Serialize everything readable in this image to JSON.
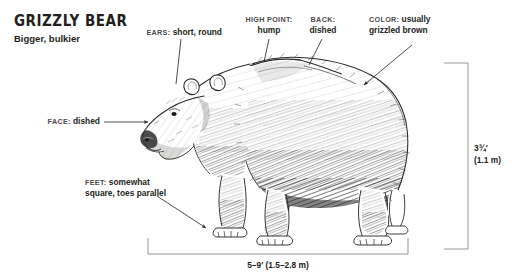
{
  "header": {
    "title": "GRIZZLY BEAR",
    "subtitle": "Bigger, bulkier"
  },
  "illustration": {
    "subject": "grizzly-bear",
    "style": "pen-and-ink hatched line drawing",
    "facing": "left",
    "ink_color": "#2b2a29",
    "background": "#ffffff"
  },
  "callouts": [
    {
      "id": "ears",
      "key": "EARS:",
      "value": "short, round",
      "leader": "line"
    },
    {
      "id": "high-point",
      "key": "HIGH POINT:",
      "value": "hump",
      "leader": "line"
    },
    {
      "id": "back",
      "key": "BACK:",
      "value": "dished",
      "leader": "line"
    },
    {
      "id": "color",
      "key": "COLOR:",
      "value": "usually grizzled brown",
      "leader": "arrow"
    },
    {
      "id": "face",
      "key": "FACE:",
      "value": "dished",
      "leader": "arrow"
    },
    {
      "id": "feet",
      "key": "FEET:",
      "value": "somewhat square, toes parallel",
      "leader": "arrow"
    }
  ],
  "callout_text": {
    "ears_key": "EARS:",
    "ears_value": "short, round",
    "high_point_key": "HIGH POINT:",
    "high_point_value": "hump",
    "back_key": "BACK:",
    "back_value": "dished",
    "color_key": "COLOR:",
    "color_value_line1": "usually",
    "color_value_line2": "grizzled brown",
    "face_key": "FACE:",
    "face_value": "dished",
    "feet_key": "FEET:",
    "feet_value_line1": "somewhat",
    "feet_value_line2": "square, toes parallel"
  },
  "dimensions": {
    "height_label_line1": "3¾′",
    "height_label_line2": "(1.1 m)",
    "length_label": "5–9′ (1.5–2.8 m)"
  },
  "colors": {
    "ink": "#231f20",
    "key_text": "#4c4a4b",
    "rule": "#8c8a8b",
    "background": "#ffffff"
  }
}
